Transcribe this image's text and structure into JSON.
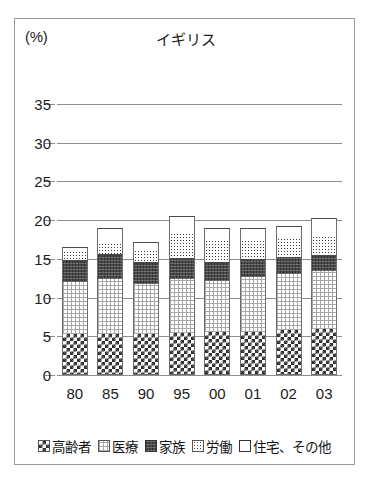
{
  "chart_data": {
    "type": "bar",
    "stacked": true,
    "title": "イギリス",
    "unit_label": "(%)",
    "xlabel": "",
    "ylabel": "",
    "ylim": [
      0,
      35
    ],
    "yticks": [
      35,
      30,
      25,
      20,
      15,
      10,
      5,
      0
    ],
    "grid": true,
    "legend_position": "bottom",
    "categories": [
      "80",
      "85",
      "90",
      "95",
      "00",
      "01",
      "02",
      "03"
    ],
    "series": [
      {
        "name": "高齢者",
        "pattern": "checkerboard",
        "values": [
          5.3,
          5.3,
          5.3,
          5.4,
          5.5,
          5.6,
          5.8,
          6.0
        ]
      },
      {
        "name": "医療",
        "pattern": "grid",
        "values": [
          6.7,
          7.1,
          6.4,
          7.0,
          6.6,
          7.0,
          7.2,
          7.4
        ]
      },
      {
        "name": "家族",
        "pattern": "dark-solid",
        "values": [
          2.8,
          3.2,
          2.9,
          2.7,
          2.5,
          2.4,
          2.3,
          2.1
        ]
      },
      {
        "name": "労働",
        "pattern": "dotted",
        "values": [
          1.2,
          1.5,
          1.6,
          3.3,
          2.9,
          2.5,
          2.4,
          2.5
        ]
      },
      {
        "name": "住宅、その他",
        "pattern": "white",
        "values": [
          0.5,
          1.9,
          1.0,
          2.2,
          1.5,
          1.5,
          1.6,
          2.3
        ]
      }
    ],
    "totals": [
      16.5,
      19.0,
      17.2,
      20.6,
      19.0,
      19.0,
      19.3,
      20.3
    ]
  },
  "legend": {
    "items": [
      {
        "label": "高齢者"
      },
      {
        "label": "医療"
      },
      {
        "label": "家族"
      },
      {
        "label": "労働"
      },
      {
        "label": "住宅、その他"
      }
    ]
  }
}
